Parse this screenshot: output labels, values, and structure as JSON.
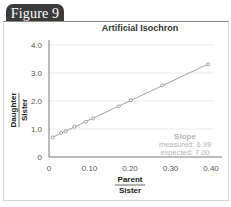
{
  "figure_tab": {
    "label": "Figure 9"
  },
  "chart_data": {
    "type": "scatter",
    "title": "Artificial Isochron",
    "xlabel": {
      "numerator": "Parent",
      "denominator": "Sister"
    },
    "ylabel": {
      "numerator": "Daughter",
      "denominator": "Sister"
    },
    "xlim": [
      0,
      0.4
    ],
    "ylim": [
      0,
      4.0
    ],
    "x_ticks": [
      "0",
      "0.10",
      "0.20",
      "0.30",
      "0.40"
    ],
    "y_ticks": [
      "0",
      "1.0",
      "2.0",
      "3.0",
      "4.0"
    ],
    "grid": "horizontal",
    "fit_line": true,
    "series": [
      {
        "name": "samples",
        "x": [
          0.009,
          0.03,
          0.041,
          0.063,
          0.091,
          0.109,
          0.172,
          0.202,
          0.28,
          0.393
        ],
        "y": [
          0.7,
          0.86,
          0.92,
          1.08,
          1.26,
          1.38,
          1.81,
          2.03,
          2.56,
          3.31
        ]
      }
    ],
    "annotation": {
      "heading": "Slope",
      "measured": "measured: 6.99",
      "expected": "expected: 7.00"
    },
    "colors": {
      "line": "#8c8c8c",
      "marker": "#7a7a7a",
      "grid": "#e6e6e6",
      "annotation": "#b8b8b8",
      "axis": "#555555"
    }
  }
}
